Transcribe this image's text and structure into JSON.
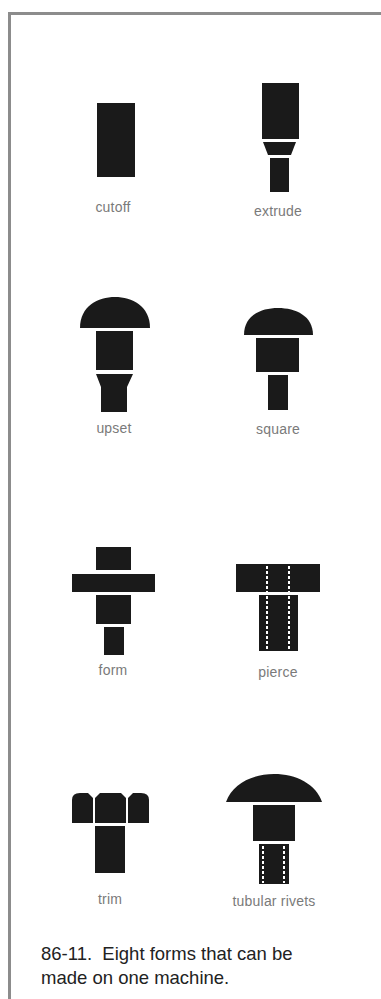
{
  "figure": {
    "number": "86-11.",
    "caption_line1": "86-11.  Eight forms that can be",
    "caption_line2": "made on one machine.",
    "ink_color": "#1a1a1a",
    "label_color": "#7a7a7a",
    "frame_color": "#8c8c8c"
  },
  "forms": [
    {
      "id": "cutoff",
      "label": "cutoff"
    },
    {
      "id": "extrude",
      "label": "extrude"
    },
    {
      "id": "upset",
      "label": "upset"
    },
    {
      "id": "square",
      "label": "square"
    },
    {
      "id": "form",
      "label": "form"
    },
    {
      "id": "pierce",
      "label": "pierce"
    },
    {
      "id": "trim",
      "label": "trim"
    },
    {
      "id": "tubular-rivets",
      "label": "tubular rivets"
    }
  ]
}
